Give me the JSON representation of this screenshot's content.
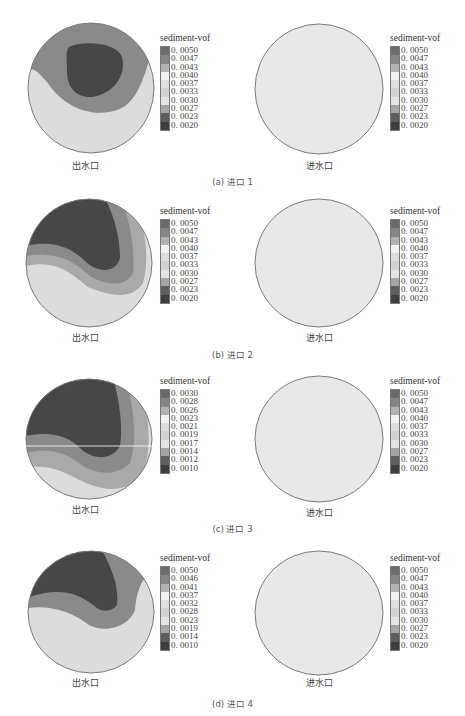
{
  "legend_title": "sediment-vof",
  "outlet_label": "出水口",
  "inlet_label": "进水口",
  "panels": [
    {
      "caption": "(a) 进口 1",
      "left_ticks": [
        "0. 0050",
        "0. 0047",
        "0. 0043",
        "0. 0040",
        "0. 0037",
        "0. 0033",
        "0. 0030",
        "0. 0027",
        "0. 0023",
        "0. 0020"
      ],
      "right_ticks": [
        "0. 0050",
        "0. 0047",
        "0. 0043",
        "0. 0040",
        "0. 0037",
        "0. 0033",
        "0. 0030",
        "0. 0027",
        "0. 0023",
        "0. 0020"
      ]
    },
    {
      "caption": "(b) 进口 2",
      "left_ticks": [
        "0. 0050",
        "0. 0047",
        "0. 0043",
        "0. 0040",
        "0. 0037",
        "0. 0033",
        "0. 0030",
        "0. 0027",
        "0. 0023",
        "0. 0020"
      ],
      "right_ticks": [
        "0. 0050",
        "0. 0047",
        "0. 0043",
        "0. 0040",
        "0. 0037",
        "0. 0033",
        "0. 0030",
        "0. 0027",
        "0. 0023",
        "0. 0020"
      ]
    },
    {
      "caption": "(c) 进口 3",
      "left_ticks": [
        "0. 0030",
        "0. 0028",
        "0. 0026",
        "0. 0023",
        "0. 0021",
        "0. 0019",
        "0. 0017",
        "0. 0014",
        "0. 0012",
        "0. 0010"
      ],
      "right_ticks": [
        "0. 0050",
        "0. 0047",
        "0. 0043",
        "0. 0040",
        "0. 0037",
        "0. 0033",
        "0. 0030",
        "0. 0027",
        "0. 0023",
        "0. 0020"
      ]
    },
    {
      "caption": "(d) 进口 4",
      "left_ticks": [
        "0. 0050",
        "0. 0046",
        "0. 0041",
        "0. 0037",
        "0. 0032",
        "0. 0028",
        "0. 0023",
        "0. 0019",
        "0. 0014",
        "0. 0010"
      ],
      "right_ticks": [
        "0. 0050",
        "0. 0047",
        "0. 0043",
        "0. 0040",
        "0. 0037",
        "0. 0033",
        "0. 0030",
        "0. 0027",
        "0. 0023",
        "0. 0020"
      ]
    }
  ],
  "legend_colors": [
    "#6b6b6b",
    "#858585",
    "#b2b2b2",
    "#f2f2f2",
    "#dedede",
    "#d2d2d2",
    "#e4e4e4",
    "#a4a4a4",
    "#5e5e5e",
    "#3e3e3e"
  ],
  "contour_colors": {
    "dark": "#474747",
    "mid": "#8a8a8a",
    "light": "#a9a9a9",
    "pale": "#dcdcdc",
    "uniform": "#e8e8e8",
    "outline": "#7a7a7a"
  }
}
